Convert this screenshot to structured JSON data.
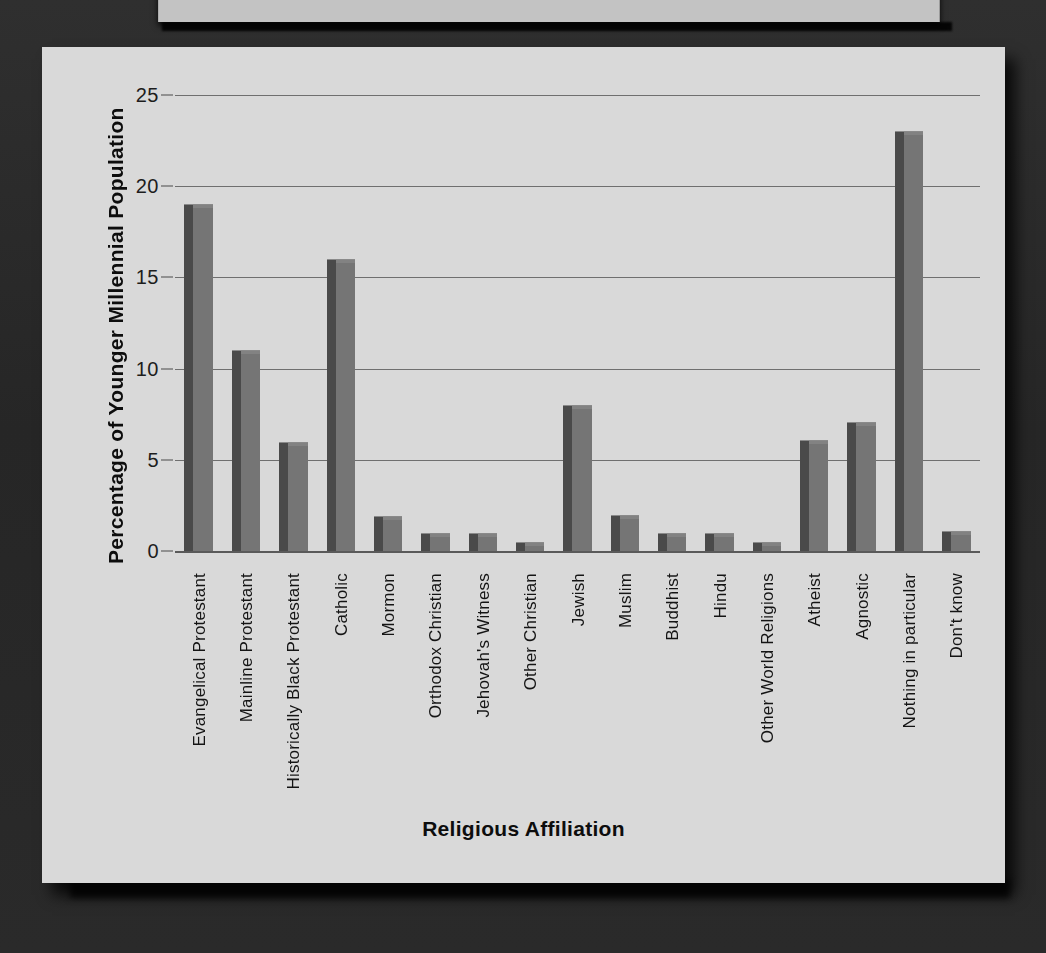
{
  "chart_data": {
    "type": "bar",
    "title": "",
    "xlabel": "Religious Affiliation",
    "ylabel": "Percentage of Younger Millennial Population",
    "ylim": [
      0,
      25
    ],
    "yticks": [
      0,
      5,
      10,
      15,
      20,
      25
    ],
    "grid": true,
    "legend": null,
    "categories": [
      "Evangelical Protestant",
      "Mainline Protestant",
      "Historically Black Protestant",
      "Catholic",
      "Mormon",
      "Orthodox Christian",
      "Jehovah's Witness",
      "Other Christian",
      "Jewish",
      "Muslim",
      "Buddhist",
      "Hindu",
      "Other World Religions",
      "Atheist",
      "Agnostic",
      "Nothing in particular",
      "Don't know"
    ],
    "values": [
      19,
      11,
      6,
      16,
      1.9,
      1,
      1,
      0.5,
      8,
      2,
      1,
      1,
      0.5,
      6.1,
      7.1,
      23,
      1.1
    ],
    "bar_color": "#757575",
    "bar_side_color": "#4a4a4a",
    "plot_background": "#d9d9d9",
    "gridline_color": "#6f6f6f"
  },
  "page": {
    "backdrop_color": "#2b2b2b",
    "panel_color": "#d9d9d9",
    "top_panel_color": "#c3c3c3"
  }
}
